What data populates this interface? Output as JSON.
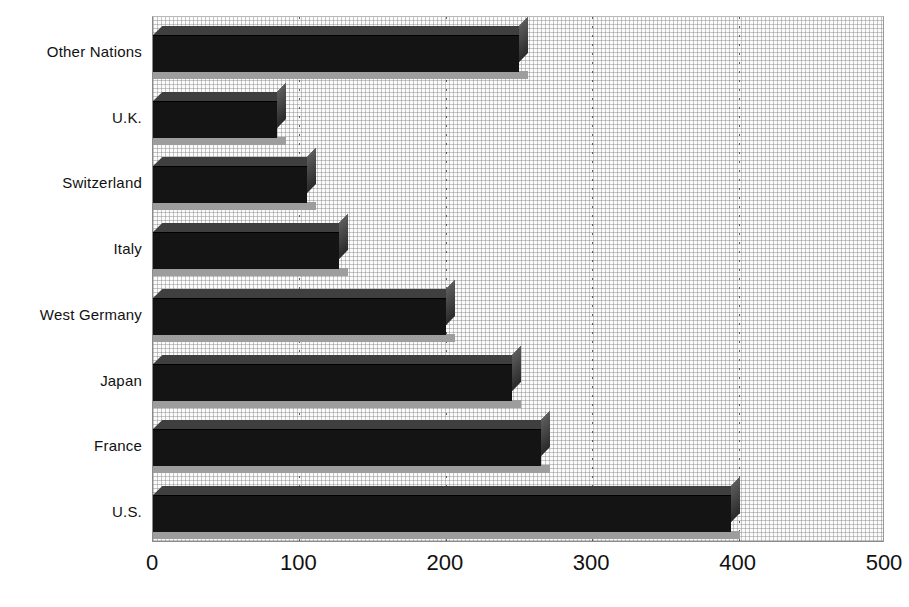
{
  "chart_data": {
    "type": "bar",
    "orientation": "horizontal",
    "title": "",
    "subtitle": "",
    "xlabel": "",
    "ylabel": "",
    "xlim": [
      0,
      500
    ],
    "ylim": null,
    "grid": true,
    "grid_axis": "x",
    "legend": false,
    "legend_position": "none",
    "xticks": [
      "0",
      "100",
      "200",
      "300",
      "400",
      "500"
    ],
    "xtick_values": [
      0,
      100,
      200,
      300,
      400,
      500
    ],
    "categories": [
      "Other Nations",
      "U.K.",
      "Switzerland",
      "Italy",
      "West Germany",
      "Japan",
      "France",
      "U.S."
    ],
    "values": [
      250,
      85,
      105,
      127,
      200,
      245,
      265,
      395
    ],
    "series": [
      {
        "name": "",
        "values": [
          250,
          85,
          105,
          127,
          200,
          245,
          265,
          395
        ]
      }
    ],
    "annotations": []
  },
  "style": {
    "bar_color": "#141414",
    "bar_top_color": "#3f3f3f",
    "bar_side_color": "#4a4a4a",
    "bar_shadow_color": "#9d9d9d",
    "plot_background": "#fbfbfb",
    "grid_color": "#2e2e2e",
    "axis_color": "#8a8a8a",
    "text_color": "#111111",
    "page_background": "#ffffff"
  }
}
